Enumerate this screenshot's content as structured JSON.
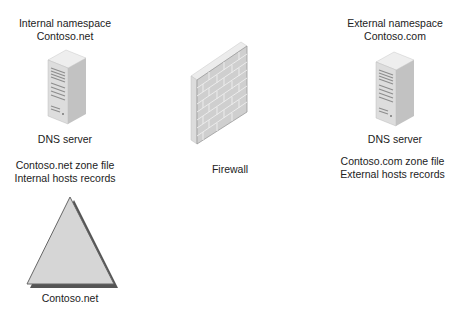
{
  "diagram": {
    "internal": {
      "namespace_line1": "Internal namespace",
      "namespace_line2": "Contoso.net",
      "server_label": "DNS server",
      "zone_line1": "Contoso.net zone file",
      "zone_line2": "Internal hosts records",
      "zone_icon": "triangle-zone-icon",
      "zone_label": "Contoso.net"
    },
    "firewall": {
      "label": "Firewall",
      "icon": "brick-wall-icon"
    },
    "external": {
      "namespace_line1": "External namespace",
      "namespace_line2": "Contoso.com",
      "server_label": "DNS server",
      "zone_line1": "Contoso.com zone file",
      "zone_line2": "External hosts records"
    },
    "colors": {
      "server_light": "#e2e2e2",
      "server_dark": "#b9b9b9",
      "wall": "#d3d3d3",
      "triangle_fill": "#d6d6d6",
      "triangle_edge": "#555555"
    }
  }
}
